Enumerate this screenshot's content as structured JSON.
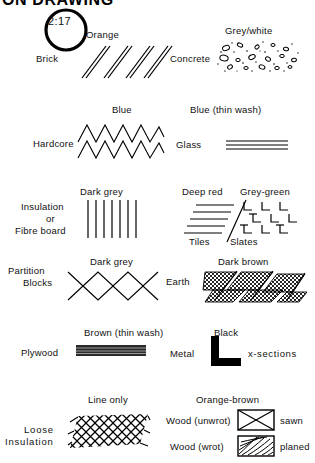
{
  "title": "ON DRAWING",
  "stamp": {
    "text": "2:17"
  },
  "entries": [
    {
      "key": "brick",
      "name": "Brick",
      "colour": "Orange",
      "symbol": "diagonal-hatch-45"
    },
    {
      "key": "concrete",
      "name": "Concrete",
      "colour": "Grey/white",
      "symbol": "aggregate-speckle"
    },
    {
      "key": "hardcore",
      "name": "Hardcore",
      "colour": "Blue",
      "symbol": "double-zigzag"
    },
    {
      "key": "glass",
      "name": "Glass",
      "colour": "Blue (thin wash)",
      "symbol": "triple-parallel-lines"
    },
    {
      "key": "insulation",
      "name": "Insulation\nor\nFibre board",
      "name_line1": "Insulation",
      "name_line2": "or",
      "name_line3": "Fibre board",
      "colour": "Dark grey",
      "symbol": "vertical-lines"
    },
    {
      "key": "tiles",
      "name": "Tiles",
      "colour": "Deep red",
      "symbol": "horizontal-lines"
    },
    {
      "key": "slates",
      "name": "Slates",
      "colour": "Grey-green",
      "symbol": "l-tick-grid"
    },
    {
      "key": "partition-blocks",
      "name": "Partition\nBlocks",
      "name_line1": "Partition",
      "name_line2": "Blocks",
      "colour": "Dark grey",
      "symbol": "crossed-diamonds"
    },
    {
      "key": "earth",
      "name": "Earth",
      "colour": "Dark brown",
      "symbol": "dense-cross-hatch-bands"
    },
    {
      "key": "plywood",
      "name": "Plywood",
      "colour": "Brown (thin wash)",
      "symbol": "solid-laminate-bar"
    },
    {
      "key": "metal",
      "name": "Metal",
      "colour": "Black",
      "symbol": "angle-section",
      "note": "x-sections"
    },
    {
      "key": "loose-insulation",
      "name": "Loose\nInsulation",
      "name_line1": "Loose",
      "name_line2": "Insulation",
      "colour": "Line only",
      "symbol": "mesh-net"
    },
    {
      "key": "wood-unwrot",
      "name": "Wood (unwrot)",
      "colour": "Orange-brown",
      "symbol": "box-with-cross",
      "note": "sawn"
    },
    {
      "key": "wood-wrot",
      "name": "Wood (wrot)",
      "colour": "Orange-brown",
      "symbol": "box-with-grain",
      "note": "planed"
    }
  ],
  "labels": {
    "orange": "Orange",
    "grey_white": "Grey/white",
    "blue": "Blue",
    "blue_thin_wash": "Blue (thin wash)",
    "dark_grey": "Dark grey",
    "dark_grey_2": "Dark grey",
    "deep_red": "Deep red",
    "grey_green": "Grey-green",
    "dark_brown": "Dark brown",
    "brown_thin_wash": "Brown (thin wash)",
    "black": "Black",
    "line_only": "Line only",
    "orange_brown": "Orange-brown",
    "brick": "Brick",
    "concrete": "Concrete",
    "hardcore": "Hardcore",
    "glass": "Glass",
    "insulation_1": "Insulation",
    "insulation_2": "or",
    "insulation_3": "Fibre board",
    "tiles": "Tiles",
    "slates": "Slates",
    "partition_1": "Partition",
    "partition_2": "Blocks",
    "earth": "Earth",
    "plywood": "Plywood",
    "metal": "Metal",
    "x_sections": "x-sections",
    "loose_1": "Loose",
    "loose_2": "Insulation",
    "wood_unwrot": "Wood (unwrot)",
    "sawn": "sawn",
    "wood_wrot": "Wood (wrot)",
    "planed": "planed"
  },
  "colors": {
    "ink": "#000000",
    "paper": "#ffffff"
  }
}
